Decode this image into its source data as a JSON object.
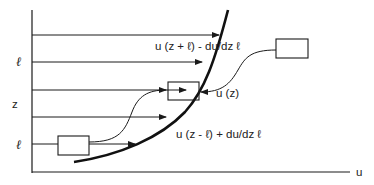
{
  "diagram": {
    "axes": {
      "x_label": "u",
      "y_labels": [
        {
          "text": "ℓ",
          "y": 62
        },
        {
          "text": "z",
          "y": 104
        },
        {
          "text": "ℓ",
          "y": 145
        }
      ]
    },
    "labels": {
      "upper": "u (z + ℓ) - du/dz ℓ",
      "middle": "u (z)",
      "lower": "u (z - ℓ) + du/dz ℓ"
    },
    "horizontal_arrows": [
      {
        "y": 35,
        "x_end": 220
      },
      {
        "y": 62,
        "x_end": 203
      },
      {
        "y": 90,
        "x_end": 186
      },
      {
        "y": 117,
        "x_end": 166
      },
      {
        "y": 144,
        "x_end": 135
      }
    ],
    "boxes": [
      {
        "name": "lower-parcel-box",
        "x": 58,
        "y": 136,
        "w": 31,
        "h": 19
      },
      {
        "name": "center-parcel-box",
        "x": 168,
        "y": 82,
        "w": 31,
        "h": 18
      },
      {
        "name": "upper-parcel-box",
        "x": 276,
        "y": 39,
        "w": 32,
        "h": 19
      }
    ],
    "colors": {
      "line": "#1a1a1a",
      "background": "#ffffff"
    }
  }
}
